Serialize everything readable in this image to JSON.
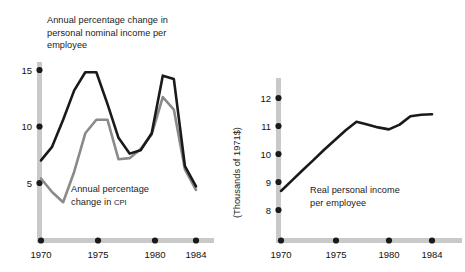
{
  "figure": {
    "background": "#ffffff",
    "axis_color": "#c9c9c9",
    "tick_dot_color": "#1a1a1a",
    "series_dark_color": "#1a1a1a",
    "series_gray_color": "#8a8a8a"
  },
  "left_panel": {
    "title_line1": "Annual percentage change in",
    "title_line2": "personal nominal income per",
    "title_line3": "employee",
    "cpi_label_line1": "Annual percentage",
    "cpi_label_line2_pre": "change in ",
    "cpi_label_line2_sc": "CPI",
    "y_ticks": [
      "15",
      "10",
      "5"
    ],
    "x_ticks": [
      "1970",
      "1975",
      "1980",
      "1984"
    ]
  },
  "right_panel": {
    "y_axis_title": "(Thousands of 1971$)",
    "series_label_line1": "Real personal income",
    "series_label_line2": "per employee",
    "y_ticks": [
      "12",
      "11",
      "10",
      "9",
      "8"
    ],
    "x_ticks": [
      "1970",
      "1975",
      "1980",
      "1984"
    ]
  },
  "chart_data": [
    {
      "type": "line",
      "title": "Annual percentage change in personal nominal income per employee",
      "xlabel": "",
      "ylabel": "Annual percentage change",
      "xlim": [
        1970,
        1984
      ],
      "ylim": [
        2.5,
        16
      ],
      "yticks": [
        5,
        10,
        15
      ],
      "xticks": [
        1970,
        1975,
        1980,
        1984
      ],
      "grid": false,
      "legend": "inline annotations",
      "x": [
        1970,
        1971,
        1972,
        1973,
        1974,
        1975,
        1976,
        1977,
        1978,
        1979,
        1980,
        1981,
        1982,
        1983,
        1984
      ],
      "series": [
        {
          "name": "Annual percentage change in personal nominal income per employee",
          "color": "#1a1a1a",
          "values": [
            7.0,
            8.2,
            10.6,
            13.2,
            14.8,
            14.8,
            12.0,
            9.0,
            7.6,
            7.9,
            9.4,
            14.5,
            14.2,
            6.5,
            4.7
          ]
        },
        {
          "name": "Annual percentage change in CPI",
          "color": "#8a8a8a",
          "values": [
            5.4,
            4.2,
            3.3,
            6.0,
            9.4,
            10.6,
            10.6,
            7.1,
            7.2,
            8.0,
            9.3,
            12.6,
            11.5,
            6.2,
            4.4
          ]
        }
      ]
    },
    {
      "type": "line",
      "title": "Real personal income per employee",
      "xlabel": "",
      "ylabel": "(Thousands of 1971$)",
      "xlim": [
        1970,
        1984
      ],
      "ylim": [
        7.5,
        12.6
      ],
      "yticks": [
        8,
        9,
        10,
        11,
        12
      ],
      "xticks": [
        1970,
        1975,
        1980,
        1984
      ],
      "grid": false,
      "x": [
        1970,
        1971,
        1972,
        1973,
        1974,
        1975,
        1976,
        1977,
        1978,
        1979,
        1980,
        1981,
        1982,
        1983,
        1984
      ],
      "series": [
        {
          "name": "Real personal income per employee",
          "color": "#1a1a1a",
          "values": [
            8.68,
            9.05,
            9.42,
            9.78,
            10.15,
            10.5,
            10.85,
            11.15,
            11.05,
            10.95,
            10.88,
            11.05,
            11.35,
            11.4,
            11.42
          ]
        }
      ]
    }
  ]
}
